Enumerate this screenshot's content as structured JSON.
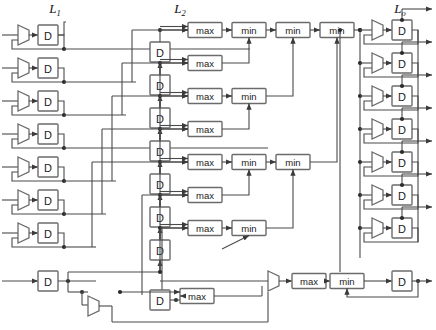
{
  "figure": {
    "type": "block-diagram",
    "width": 436,
    "height": 330,
    "background": "#ffffff",
    "line_color": "#4a4a4a",
    "box_stroke": "#6b6b6b",
    "box_fill": "#ffffff",
    "text_color": "#1a1a1a"
  },
  "column_labels": [
    {
      "name": "label-L1",
      "base": "L",
      "sub": "1",
      "x": 55,
      "y": 13
    },
    {
      "name": "label-L2",
      "base": "L",
      "sub": "2",
      "x": 180,
      "y": 13
    },
    {
      "name": "label-Lo",
      "base": "L",
      "sub": "o",
      "x": 400,
      "y": 13
    }
  ],
  "blocks": {
    "d_label": "D",
    "max_label": "max",
    "min_label": "min"
  },
  "stage_L1": {
    "name": "input-register-stage",
    "mux_count": 7,
    "register_count": 7,
    "extra_register_count": 1,
    "rows": [
      {
        "index": 1,
        "y": 35,
        "mux_x": 20,
        "d_x": 38
      },
      {
        "index": 2,
        "y": 68,
        "mux_x": 20,
        "d_x": 38
      },
      {
        "index": 3,
        "y": 101,
        "mux_x": 20,
        "d_x": 38
      },
      {
        "index": 4,
        "y": 134,
        "mux_x": 20,
        "d_x": 38
      },
      {
        "index": 5,
        "y": 167,
        "mux_x": 20,
        "d_x": 38
      },
      {
        "index": 6,
        "y": 200,
        "mux_x": 20,
        "d_x": 38
      },
      {
        "index": 7,
        "y": 233,
        "mux_x": 20,
        "d_x": 38
      }
    ],
    "extra_row": {
      "index": 8,
      "y": 281,
      "d_x": 38
    }
  },
  "stage_L2": {
    "name": "delay-register-chain",
    "register_count": 7,
    "extra_register_count": 1,
    "registers": [
      {
        "index": 1,
        "y": 52
      },
      {
        "index": 2,
        "y": 85
      },
      {
        "index": 3,
        "y": 118
      },
      {
        "index": 4,
        "y": 151
      },
      {
        "index": 5,
        "y": 184
      },
      {
        "index": 6,
        "y": 217
      },
      {
        "index": 7,
        "y": 250
      }
    ],
    "extra_register": {
      "index": 8,
      "y": 300
    }
  },
  "max_stage": {
    "name": "max-comparator-column",
    "count": 7,
    "rows": [
      {
        "index": 1,
        "y": 30
      },
      {
        "index": 2,
        "y": 63
      },
      {
        "index": 3,
        "y": 96
      },
      {
        "index": 4,
        "y": 129
      },
      {
        "index": 5,
        "y": 162
      },
      {
        "index": 6,
        "y": 195
      },
      {
        "index": 7,
        "y": 228
      }
    ],
    "extra_max_bottom": {
      "index": 8,
      "y": 296
    },
    "extra_max_final": {
      "index": 9,
      "y": 281
    }
  },
  "min_stage": {
    "name": "min-reduction-tree",
    "level1": [
      {
        "index": 1,
        "y": 30
      },
      {
        "index": 2,
        "y": 96
      },
      {
        "index": 3,
        "y": 162
      },
      {
        "index": 4,
        "y": 228
      }
    ],
    "level2": [
      {
        "index": 1,
        "y": 30
      },
      {
        "index": 2,
        "y": 162
      }
    ],
    "level3": [
      {
        "index": 1,
        "y": 30
      }
    ],
    "bottom_min": {
      "index": 1,
      "y": 281
    }
  },
  "stage_Lo": {
    "name": "output-register-stage",
    "mux_count": 7,
    "register_count": 7,
    "output_count": 7,
    "rows": [
      {
        "index": 1,
        "y": 30
      },
      {
        "index": 2,
        "y": 63
      },
      {
        "index": 3,
        "y": 96
      },
      {
        "index": 4,
        "y": 129
      },
      {
        "index": 5,
        "y": 162
      },
      {
        "index": 6,
        "y": 195
      },
      {
        "index": 7,
        "y": 228
      }
    ],
    "final_register": {
      "index": 8,
      "y": 281
    }
  },
  "counts": {
    "total_d_registers": 24,
    "total_max_blocks": 9,
    "total_min_blocks": 8,
    "total_muxes": 15
  }
}
